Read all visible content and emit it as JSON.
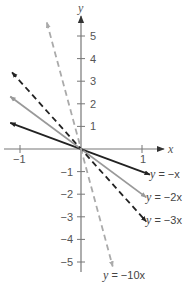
{
  "chart_data": {
    "type": "line",
    "title": "",
    "xlabel": "x",
    "ylabel": "y",
    "xlim": [
      -1.15,
      1.35
    ],
    "ylim": [
      -5.5,
      5.6
    ],
    "grid": false,
    "x_ticks": [
      {
        "value": -1,
        "label": "−1"
      },
      {
        "value": 1,
        "label": "1"
      }
    ],
    "y_ticks": [
      {
        "value": 5,
        "label": "5"
      },
      {
        "value": 4,
        "label": "4"
      },
      {
        "value": 3,
        "label": "3"
      },
      {
        "value": 2,
        "label": "2"
      },
      {
        "value": 1,
        "label": "1"
      },
      {
        "value": -1,
        "label": "−1"
      },
      {
        "value": -2,
        "label": "−2"
      },
      {
        "value": -3,
        "label": "−3"
      },
      {
        "value": -4,
        "label": "−4"
      },
      {
        "value": -5,
        "label": "−5"
      }
    ],
    "series": [
      {
        "name": "y = −x",
        "slope": -1,
        "x_range": [
          -1.16,
          1.13
        ],
        "color": "#222222",
        "dash": false,
        "label_lhs": "y",
        "label_rhs": " = −x"
      },
      {
        "name": "y = −2x",
        "slope": -2,
        "x_range": [
          -1.16,
          1.07
        ],
        "color": "#999999",
        "dash": false,
        "label_lhs": "y",
        "label_rhs": " = −2x"
      },
      {
        "name": "y = −3x",
        "slope": -3,
        "x_range": [
          -1.13,
          1.07
        ],
        "color": "#222222",
        "dash": true,
        "label_lhs": "y",
        "label_rhs": " = −3x"
      },
      {
        "name": "y = −10x",
        "slope": -10,
        "x_range": [
          -0.56,
          0.52
        ],
        "color": "#aaaaaa",
        "dash": true,
        "label_lhs": "y",
        "label_rhs": " = −10x"
      }
    ],
    "legend_position": "inline-right"
  },
  "axes": {
    "x_label": "x",
    "y_label": "y"
  }
}
